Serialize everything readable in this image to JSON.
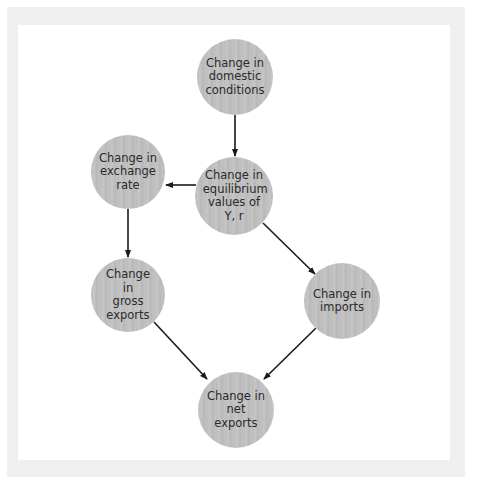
{
  "diagram": {
    "type": "flowchart",
    "colors": {
      "node_fill": "#c0c0c0",
      "node_text": "#2a2a2a",
      "arrow": "#1a1a1a",
      "frame": "#efefef",
      "panel": "#ffffff"
    },
    "nodes": [
      {
        "id": "domestic",
        "label": "Change in domestic conditions",
        "cx": 235,
        "cy": 77,
        "r": 38
      },
      {
        "id": "equilibrium",
        "label": "Change in equilibrium values of Y, r",
        "cx": 234,
        "cy": 196,
        "r": 39
      },
      {
        "id": "exchange",
        "label": "Change in exchange rate",
        "cx": 128,
        "cy": 172,
        "r": 37
      },
      {
        "id": "gross_exports",
        "label": "Change in gross exports",
        "cx": 128,
        "cy": 295,
        "r": 37
      },
      {
        "id": "imports",
        "label": "Change in imports",
        "cx": 342,
        "cy": 301,
        "r": 38
      },
      {
        "id": "net_exports",
        "label": "Change in net exports",
        "cx": 236,
        "cy": 410,
        "r": 38
      }
    ],
    "edges": [
      {
        "from": "domestic",
        "to": "equilibrium"
      },
      {
        "from": "equilibrium",
        "to": "exchange"
      },
      {
        "from": "exchange",
        "to": "gross_exports"
      },
      {
        "from": "equilibrium",
        "to": "imports"
      },
      {
        "from": "gross_exports",
        "to": "net_exports"
      },
      {
        "from": "imports",
        "to": "net_exports"
      }
    ]
  }
}
